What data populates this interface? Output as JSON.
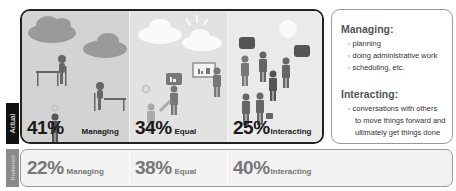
{
  "actual": {
    "tab_label": "Actual",
    "sections": [
      {
        "percent": "41%",
        "label": "Managing"
      },
      {
        "percent": "34%",
        "label": "Equal"
      },
      {
        "percent": "25%",
        "label": "Interacting"
      }
    ]
  },
  "preferred": {
    "tab_label": "Preferred",
    "sections": [
      {
        "percent": "22%",
        "label": "Managing"
      },
      {
        "percent": "38%",
        "label": "Equal"
      },
      {
        "percent": "40%",
        "label": "Interacting"
      }
    ]
  },
  "legend": {
    "managing": {
      "title": "Managing:",
      "items": [
        "planning",
        "doing administrative work",
        "scheduling, etc."
      ]
    },
    "interacting": {
      "title": "Interacting:",
      "items": [
        "conversations with others"
      ],
      "continuation": [
        "to move things forward and",
        "ultimately get things done"
      ]
    }
  },
  "colors": {
    "managing_bg": "#d3d3d3",
    "equal_bg": "#e2e2e2",
    "interacting_bg": "#eaeaea",
    "actual_tab": "#111111",
    "preferred_tab": "#8a8a8a"
  }
}
